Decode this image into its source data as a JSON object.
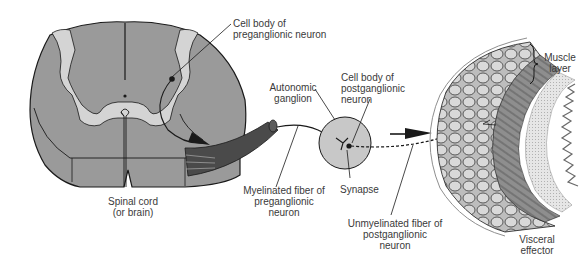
{
  "diagram": {
    "colors": {
      "white_matter": "#9a9a9a",
      "gray_matter": "#d4d4d4",
      "nerve_root": "#4a4a4a",
      "ganglion": "#c8c8c8",
      "outline": "#1a1a1a",
      "label_text": "#3a3a3a",
      "background": "#ffffff"
    },
    "labels": {
      "cell_body_pre": [
        "Cell body of",
        "preganglionic neuron"
      ],
      "autonomic_ganglion": [
        "Autonomic",
        "ganglion"
      ],
      "cell_body_post": [
        "Cell body of",
        "postganglionic",
        "neuron"
      ],
      "muscle_layer": [
        "Muscle",
        "layer"
      ],
      "spinal_cord": [
        "Spinal cord",
        "(or brain)"
      ],
      "myelinated_fiber": [
        "Myelinated fiber of",
        "preganglionic",
        "neuron"
      ],
      "synapse": [
        "Synapse"
      ],
      "unmyelinated_fiber": [
        "Unmyelinated fiber of",
        "postganglionic",
        "neuron"
      ],
      "visceral_effector": [
        "Visceral",
        "effector"
      ]
    },
    "nodes": [
      {
        "id": "spinal-cord",
        "label": "Spinal cord (or brain)"
      },
      {
        "id": "preganglionic-cell-body",
        "label": "Cell body of preganglionic neuron"
      },
      {
        "id": "myelinated-fiber",
        "label": "Myelinated fiber of preganglionic neuron"
      },
      {
        "id": "autonomic-ganglion",
        "label": "Autonomic ganglion"
      },
      {
        "id": "synapse",
        "label": "Synapse"
      },
      {
        "id": "postganglionic-cell-body",
        "label": "Cell body of postganglionic neuron"
      },
      {
        "id": "unmyelinated-fiber",
        "label": "Unmyelinated fiber of postganglionic neuron"
      },
      {
        "id": "visceral-effector",
        "label": "Visceral effector"
      },
      {
        "id": "muscle-layer",
        "label": "Muscle layer"
      }
    ],
    "edges": [
      {
        "from": "preganglionic-cell-body",
        "to": "autonomic-ganglion",
        "style": "solid",
        "via": "myelinated-fiber"
      },
      {
        "from": "postganglionic-cell-body",
        "to": "visceral-effector",
        "style": "dashed",
        "via": "unmyelinated-fiber"
      }
    ]
  }
}
